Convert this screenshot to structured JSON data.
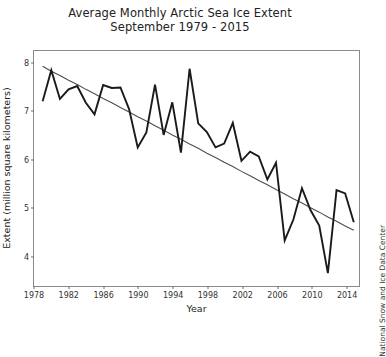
{
  "chart_data": {
    "type": "line",
    "title": "Average Monthly Arctic Sea Ice Extent",
    "subtitle": "September 1979 - 2015",
    "xlabel": "Year",
    "ylabel": "Extent (million square kilometers)",
    "credit": "National Snow and Ice Data Center",
    "grid": false,
    "legend": "none",
    "xlim": [
      1978,
      2015.6
    ],
    "ylim": [
      3.35,
      8.25
    ],
    "xticks": [
      1978,
      1982,
      1986,
      1990,
      1994,
      1998,
      2002,
      2006,
      2010,
      2014
    ],
    "yticks": [
      4,
      5,
      6,
      7,
      8
    ],
    "x": [
      1979,
      1980,
      1981,
      1982,
      1983,
      1984,
      1985,
      1986,
      1987,
      1988,
      1989,
      1990,
      1991,
      1992,
      1993,
      1994,
      1995,
      1996,
      1997,
      1998,
      1999,
      2000,
      2001,
      2002,
      2003,
      2004,
      2005,
      2006,
      2007,
      2008,
      2009,
      2010,
      2011,
      2012,
      2013,
      2014,
      2015
    ],
    "series": [
      {
        "name": "September sea ice extent",
        "color": "#1a1a1a",
        "values": [
          7.2,
          7.85,
          7.25,
          7.45,
          7.52,
          7.17,
          6.93,
          7.54,
          7.48,
          7.49,
          7.04,
          6.24,
          6.55,
          7.55,
          6.5,
          7.18,
          6.13,
          7.88,
          6.74,
          6.56,
          6.24,
          6.32,
          6.75,
          5.96,
          6.15,
          6.05,
          5.57,
          5.92,
          4.3,
          4.73,
          5.39,
          4.93,
          4.61,
          3.62,
          5.35,
          5.28,
          4.68
        ]
      },
      {
        "name": "Linear trend",
        "color": "#4d4d4d",
        "values": [
          7.93,
          7.83,
          7.74,
          7.64,
          7.55,
          7.45,
          7.36,
          7.26,
          7.17,
          7.07,
          6.98,
          6.88,
          6.79,
          6.69,
          6.6,
          6.5,
          6.41,
          6.31,
          6.22,
          6.12,
          6.03,
          5.93,
          5.84,
          5.74,
          5.65,
          5.55,
          5.46,
          5.36,
          5.27,
          5.17,
          5.08,
          4.98,
          4.89,
          4.79,
          4.7,
          4.6,
          4.51
        ]
      }
    ]
  }
}
